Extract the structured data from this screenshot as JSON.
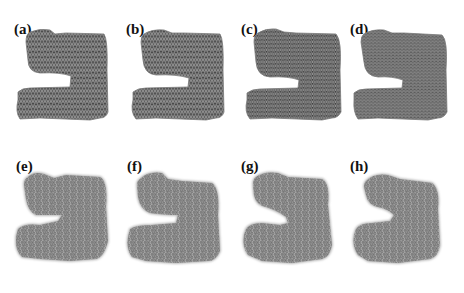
{
  "figure": {
    "panels": [
      {
        "label": "(a)",
        "row": 1,
        "style": "triangular-mesh-coarse",
        "fill": "#8c8c8c"
      },
      {
        "label": "(b)",
        "row": 1,
        "style": "triangular-mesh-coarse",
        "fill": "#8a8a8a"
      },
      {
        "label": "(c)",
        "row": 1,
        "style": "triangular-mesh-fine",
        "fill": "#868686"
      },
      {
        "label": "(d)",
        "row": 1,
        "style": "triangular-mesh-finest",
        "fill": "#808080"
      },
      {
        "label": "(e)",
        "row": 2,
        "style": "point-cloud-fuzzy",
        "fill": "#8e8e8e"
      },
      {
        "label": "(f)",
        "row": 2,
        "style": "point-cloud-fuzzy",
        "fill": "#8e8e8e"
      },
      {
        "label": "(g)",
        "row": 2,
        "style": "point-cloud-fuzzy",
        "fill": "#8c8c8c"
      },
      {
        "label": "(h)",
        "row": 2,
        "style": "point-cloud-fuzzy",
        "fill": "#8c8c8c"
      }
    ]
  }
}
